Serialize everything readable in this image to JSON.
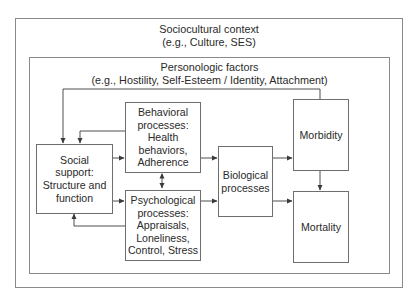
{
  "outer_frame": {
    "title": "Sociocultural context",
    "subtitle": "(e.g., Culture, SES)"
  },
  "inner_frame": {
    "title": "Personologic factors",
    "subtitle": "(e.g., Hostility, Self-Esteem / Identity, Attachment)"
  },
  "nodes": {
    "social_support": {
      "lines": [
        "Social",
        "support:",
        "Structure and",
        "function"
      ]
    },
    "behavioral": {
      "lines": [
        "Behavioral",
        "processes:",
        "Health",
        "behaviors,",
        "Adherence"
      ]
    },
    "psychological": {
      "lines": [
        "Psychological",
        "processes:",
        "Appraisals,",
        "Loneliness,",
        "Control, Stress"
      ]
    },
    "biological": {
      "lines": [
        "Biological",
        "processes"
      ]
    },
    "morbidity": {
      "lines": [
        "Morbidity"
      ]
    },
    "mortality": {
      "lines": [
        "Mortality"
      ]
    }
  },
  "edges": [
    {
      "from": "social_support",
      "to": "behavioral"
    },
    {
      "from": "social_support",
      "to": "psychological"
    },
    {
      "from": "behavioral",
      "to": "psychological",
      "bidirectional": true
    },
    {
      "from": "behavioral",
      "to": "biological"
    },
    {
      "from": "psychological",
      "to": "biological"
    },
    {
      "from": "biological",
      "to": "morbidity"
    },
    {
      "from": "biological",
      "to": "mortality"
    },
    {
      "from": "morbidity",
      "to": "mortality"
    },
    {
      "from": "morbidity",
      "to": "social_support",
      "type": "feedback"
    },
    {
      "from": "behavioral",
      "to": "social_support",
      "type": "feedback"
    },
    {
      "from": "psychological",
      "to": "social_support",
      "type": "feedback"
    }
  ],
  "colors": {
    "frame": "#8a8a8a",
    "box_border": "#6e6e6e",
    "line": "#3a3a3a",
    "text": "#2a2a2a"
  }
}
